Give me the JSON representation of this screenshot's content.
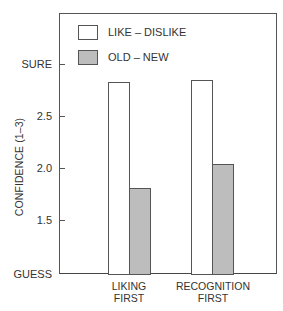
{
  "chart_data": {
    "type": "bar",
    "title": "",
    "xlabel": "",
    "ylabel": "CONFIDENCE (1–3)",
    "categories": [
      "LIKING FIRST",
      "RECOGNITION FIRST"
    ],
    "category_lines": [
      [
        "LIKING",
        "FIRST"
      ],
      [
        "RECOGNITION",
        "FIRST"
      ]
    ],
    "series": [
      {
        "name": "LIKE – DISLIKE",
        "color": "#ffffff",
        "values": [
          2.83,
          2.85
        ]
      },
      {
        "name": "OLD – NEW",
        "color": "#bdbdbd",
        "values": [
          1.82,
          2.05
        ]
      }
    ],
    "ylim": [
      1.0,
      3.0
    ],
    "yticks": [
      {
        "value": 3.0,
        "label": "SURE"
      },
      {
        "value": 2.5,
        "label": "2.5"
      },
      {
        "value": 2.0,
        "label": "2.0"
      },
      {
        "value": 1.5,
        "label": "1.5"
      },
      {
        "value": 1.0,
        "label": "GUESS"
      }
    ],
    "grid": false,
    "legend_position": "upper left inside"
  }
}
